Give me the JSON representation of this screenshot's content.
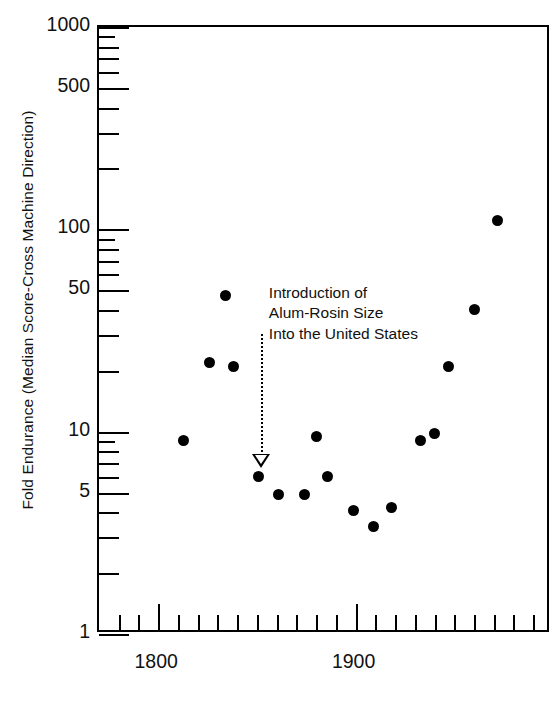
{
  "chart_data": {
    "type": "scatter",
    "title": "",
    "xlabel": "",
    "ylabel": "Fold Endurance (Median Score-Cross Machine Direction)",
    "xlim": [
      1770,
      1999
    ],
    "ylim": [
      1,
      1000
    ],
    "yscale": "log",
    "xscale": "linear",
    "grid": false,
    "legend": false,
    "ytick_labels": [
      "1000",
      "500",
      "100",
      "50",
      "10",
      "5",
      "1"
    ],
    "ytick_values": [
      1000,
      500,
      100,
      50,
      10,
      5,
      1
    ],
    "yminor_values": [
      900,
      800,
      700,
      600,
      400,
      300,
      200,
      90,
      80,
      70,
      60,
      40,
      30,
      20,
      9,
      8,
      7,
      6,
      4,
      3,
      2
    ],
    "xtick_labels": [
      "1800",
      "1900"
    ],
    "xtick_values": [
      1800,
      1900
    ],
    "xminor_step": 10,
    "xminor_values": [
      1780,
      1790,
      1810,
      1820,
      1830,
      1840,
      1850,
      1860,
      1870,
      1880,
      1890,
      1910,
      1920,
      1930,
      1940,
      1950,
      1960,
      1970,
      1980,
      1990
    ],
    "marker": "filled-circle",
    "series": [
      {
        "name": "Fold endurance by year",
        "marker": "filled-circle",
        "points": [
          {
            "x": 1813,
            "y": 9.0
          },
          {
            "x": 1826,
            "y": 22.0
          },
          {
            "x": 1834,
            "y": 47.0
          },
          {
            "x": 1838,
            "y": 21.0
          },
          {
            "x": 1851,
            "y": 6.0
          },
          {
            "x": 1861,
            "y": 4.9
          },
          {
            "x": 1874,
            "y": 4.9
          },
          {
            "x": 1880,
            "y": 9.5
          },
          {
            "x": 1886,
            "y": 6.0
          },
          {
            "x": 1899,
            "y": 4.1
          },
          {
            "x": 1909,
            "y": 3.4
          },
          {
            "x": 1918,
            "y": 4.2
          },
          {
            "x": 1933,
            "y": 9.0
          },
          {
            "x": 1940,
            "y": 9.8
          },
          {
            "x": 1947,
            "y": 21.0
          },
          {
            "x": 1960,
            "y": 40.0
          },
          {
            "x": 1972,
            "y": 110.0
          }
        ]
      }
    ],
    "annotations": [
      {
        "name": "alum-rosin-annotation",
        "text": "Introduction of\nAlum-Rosin Size\nInto the United States",
        "x": 1852,
        "y": 47,
        "marker": "down-triangle-open",
        "marker_x": 1852,
        "marker_y": 7.2,
        "connector": "dotted-vertical"
      }
    ]
  },
  "axes": {
    "y_title": "Fold Endurance (Median Score-Cross Machine Direction)",
    "y_labels": [
      "1000",
      "500",
      "100",
      "50",
      "10",
      "5",
      "1"
    ],
    "x_labels": [
      "1800",
      "1900"
    ]
  },
  "annotation": {
    "line1": "Introduction of",
    "line2": "Alum-Rosin Size",
    "line3": "Into the United States"
  }
}
